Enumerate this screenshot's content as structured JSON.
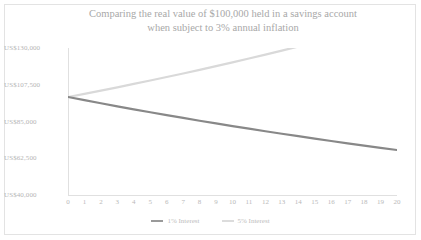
{
  "chart_data": {
    "type": "line",
    "title": "Comparing the real value of $100,000 held in a savings account when subject to 3% annual inflation",
    "title_lines": [
      "Comparing the real value of $100,000 held in a savings account",
      "when subject to 3% annual inflation"
    ],
    "xlabel": "",
    "ylabel": "",
    "xlim": [
      0,
      20
    ],
    "ylim": [
      40000,
      130000
    ],
    "grid": false,
    "legend_position": "bottom",
    "x": [
      0,
      1,
      2,
      3,
      4,
      5,
      6,
      7,
      8,
      9,
      10,
      11,
      12,
      13,
      14,
      15,
      16,
      17,
      18,
      19,
      20
    ],
    "categories": [
      "0",
      "1",
      "2",
      "3",
      "4",
      "5",
      "6",
      "7",
      "8",
      "9",
      "10",
      "11",
      "12",
      "13",
      "14",
      "15",
      "16",
      "17",
      "18",
      "19",
      "20"
    ],
    "ytick_labels": [
      "US$130,000",
      "US$107,500",
      "US$85,000",
      "US$62,500",
      "US$40,000"
    ],
    "ytick_values": [
      130000,
      107500,
      85000,
      62500,
      40000
    ],
    "series": [
      {
        "name": "1% Interest",
        "color": "#888888",
        "values": [
          100000,
          98058,
          96154,
          94287,
          92456,
          90661,
          88901,
          87175,
          85482,
          83822,
          82195,
          80599,
          79034,
          77499,
          75994,
          74518,
          73071,
          71652,
          70260,
          68895,
          67557
        ]
      },
      {
        "name": "5% Interest",
        "color": "#d9d9d9",
        "values": [
          100000,
          101942,
          103922,
          105940,
          107998,
          110095,
          112233,
          114413,
          116634,
          118899,
          121208,
          123561,
          125960,
          128406,
          130899,
          133441,
          136032,
          138673,
          141366,
          144111,
          146910
        ]
      }
    ]
  },
  "legend": {
    "entries": [
      {
        "label": "1% Interest",
        "color": "#9a9a9a"
      },
      {
        "label": "5% Interest",
        "color": "#dcdcdc"
      }
    ]
  },
  "colors": {
    "border": "#e3e3e3",
    "title_text": "#a8a8a8",
    "tick_text": "#b9b9b9",
    "axis_line": "#e0e0e0",
    "series_1pct": "#888888",
    "series_5pct": "#d9d9d9"
  }
}
